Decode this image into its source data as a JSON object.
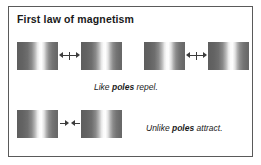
{
  "figure": {
    "title": "First law of magnetism",
    "border_color": "#5a5a5a",
    "background_color": "#ffffff",
    "text_color": "#1a1a1a",
    "arrow_color": "#3c3c3c"
  },
  "captions": {
    "repel": {
      "lead": "Like ",
      "emphasis": "poles",
      "trail": " repel."
    },
    "attract": {
      "lead": "Unlike ",
      "emphasis": "poles",
      "trail": " attract."
    }
  },
  "rows": [
    {
      "name": "like-poles-repel-row",
      "caption_key": "repel",
      "pairs": [
        {
          "name": "repel-pair-left",
          "arrow_direction": "outward"
        },
        {
          "name": "repel-pair-right",
          "arrow_direction": "outward"
        }
      ]
    },
    {
      "name": "unlike-poles-attract-row",
      "caption_key": "attract",
      "pairs": [
        {
          "name": "attract-pair",
          "arrow_direction": "inward"
        }
      ]
    }
  ],
  "magnets": {
    "count_total": 6,
    "bar_width_px": 41,
    "bar_height_px": 28,
    "gradient_description": "dark-gray edges with bright white pole band right of center"
  }
}
